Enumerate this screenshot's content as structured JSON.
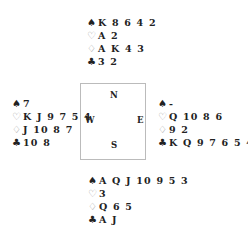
{
  "diagram": {
    "type": "bridge-deal",
    "compass": {
      "north": "N",
      "south": "S",
      "west": "W",
      "east": "E"
    },
    "suits": {
      "spades": "♠",
      "hearts": "♡",
      "diamonds": "♢",
      "clubs": "♣"
    },
    "hands": {
      "north": {
        "spades": "K 8 6 4 2",
        "hearts": "A 2",
        "diamonds": "A K 4 3",
        "clubs": "3 2"
      },
      "west": {
        "spades": "7",
        "hearts": "K J 9 7 5 4",
        "diamonds": "J 10 8 7",
        "clubs": "10 8"
      },
      "east": {
        "spades": "-",
        "hearts": "Q 10 8 6",
        "diamonds": "9 2",
        "clubs": "K Q 9 7 6 5 4"
      },
      "south": {
        "spades": "A Q J 10 9 5 3",
        "hearts": "3",
        "diamonds": "Q 6 5",
        "clubs": "A J"
      }
    }
  }
}
